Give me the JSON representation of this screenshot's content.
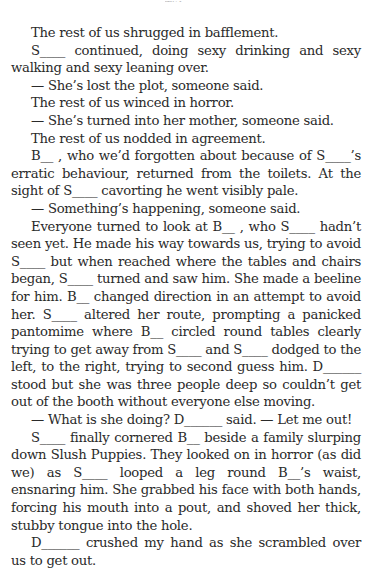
{
  "header": {
    "running_head": "Title"
  },
  "paragraphs": [
    "The rest of us shrugged in bafflement.",
    "S____ continued, doing sexy drinking and sexy walking and sexy leaning over.",
    "— She’s lost the plot, someone said.",
    "The rest of us winced in horror.",
    "— She’s turned into her mother, someone said.",
    "The rest of us nodded in agreement.",
    "B__ , who we’d forgotten about because of S____’s erratic behaviour, returned from the toilets. At the sight of S____ cavorting he went visibly pale.",
    "— Something’s happening, someone said.",
    "Everyone turned to look at B__ , who S____ hadn’t seen yet. He made his way towards us, trying to avoid S____ but when reached where the tables and chairs began, S____ turned and saw him. She made a beeline for him. B__ changed direction in an attempt to avoid her. S____ altered her route, prompting a panicked pantomime where B__ circled round tables clearly trying to get away from S____ and S____ dodged to the left, to the right, trying to second guess him. D______ stood but she was three people deep so couldn’t get out of the booth without everyone else moving.",
    "— What is she doing? D______ said. — Let me out!",
    "S____ finally cornered B__ beside a family slurping down Slush Puppies. They looked on in horror (as did we) as S____ looped a leg round B__’s waist, ensnaring him. She grabbed his face with both hands, forcing his mouth into a pout, and shoved her thick, stubby tongue into the hole.",
    "D______ crushed my hand as she scrambled over us to get out."
  ]
}
